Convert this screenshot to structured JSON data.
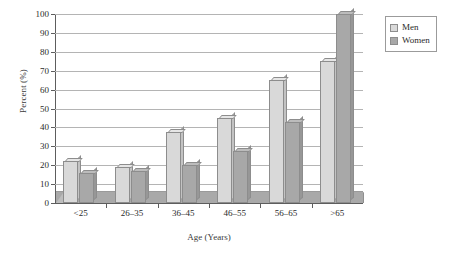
{
  "chart_data": {
    "type": "bar",
    "title": "",
    "subtitle": "",
    "xlabel": "Age (Years)",
    "ylabel": "Percent (%)",
    "categories": [
      "<25",
      "26–35",
      "36–45",
      "46–55",
      "56–65",
      ">65"
    ],
    "series": [
      {
        "name": "Men",
        "values": [
          22,
          19,
          37.5,
          45,
          65,
          75
        ],
        "color": "#d9d9d9"
      },
      {
        "name": "Women",
        "values": [
          16,
          17,
          20,
          27.5,
          43,
          100
        ],
        "color": "#a8a8a8"
      }
    ],
    "ylim": [
      0,
      100
    ],
    "ytick_labels": [
      "0",
      "10",
      "20",
      "30",
      "40",
      "50",
      "60",
      "70",
      "80",
      "90",
      "100"
    ],
    "ytick_values": [
      0,
      10,
      20,
      30,
      40,
      50,
      60,
      70,
      80,
      90,
      100
    ],
    "grid": "horizontal",
    "legend_position": "top-right",
    "style": "3d-grouped-bars"
  },
  "legend": {
    "items": [
      {
        "label": "Men",
        "color": "#d9d9d9"
      },
      {
        "label": "Women",
        "color": "#a8a8a8"
      }
    ]
  },
  "colors": {
    "men": "#d9d9d9",
    "women": "#a8a8a8",
    "gridline": "#b4b4b4",
    "axis": "#5d5d5d",
    "floor": "#a9a9a9",
    "background": "#ffffff"
  }
}
